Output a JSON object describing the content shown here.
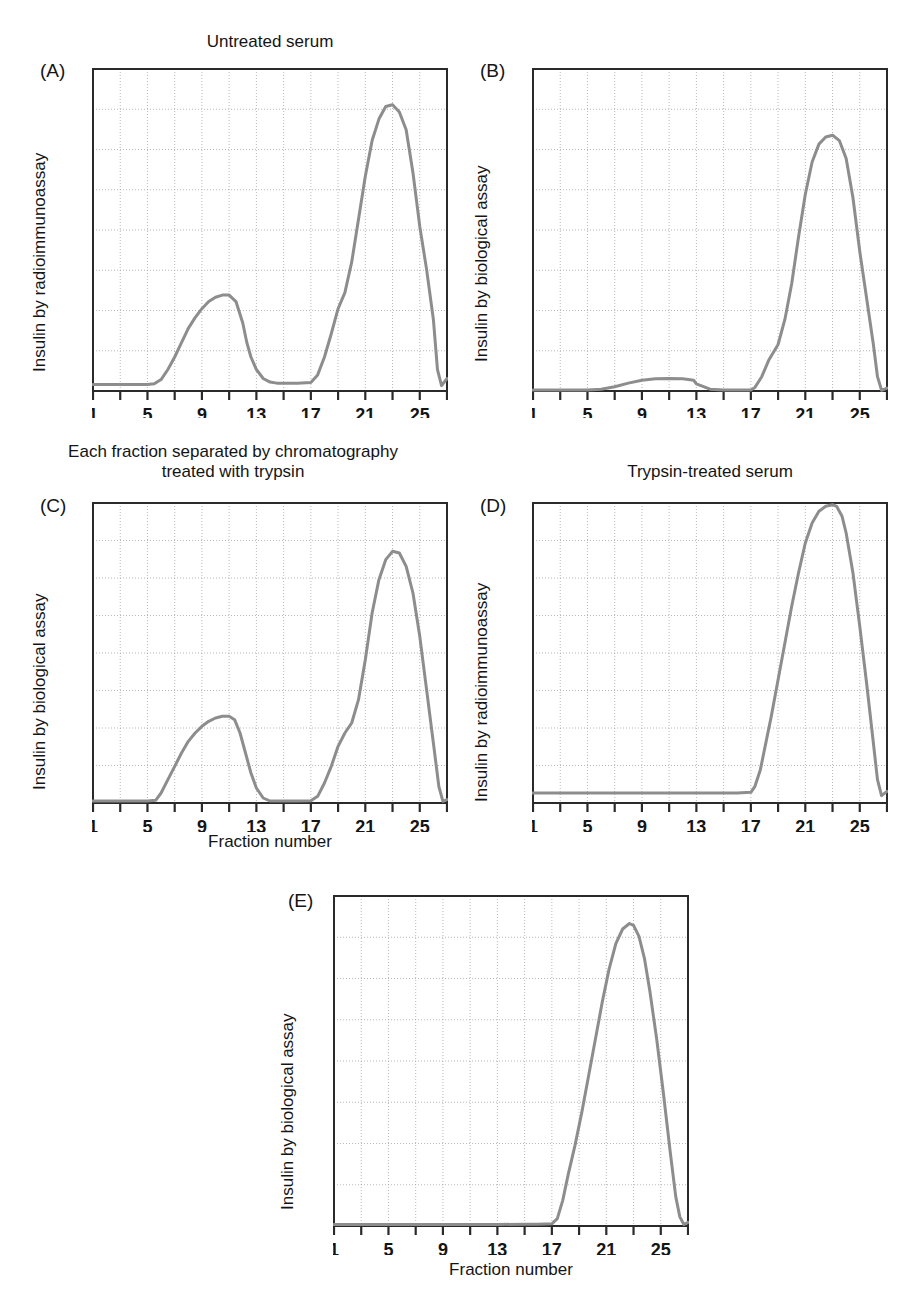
{
  "figure": {
    "titles": {
      "a": "Untreated serum",
      "b": "",
      "c": "Each fraction separated by chromatography\ntreated with trypsin",
      "d": "Trypsin-treated serum",
      "e": ""
    },
    "letters": {
      "a": "(A)",
      "b": "(B)",
      "c": "(C)",
      "d": "(D)",
      "e": "(E)"
    },
    "axis_labels": {
      "radioimmunoassay": "Insulin by radioimmunoassay",
      "biological": "Insulin by biological assay",
      "fraction": "Fraction number"
    },
    "colors": {
      "curve": "#8d8d8d",
      "frame": "#2a2a2a",
      "grid": "#9a9a9a",
      "text": "#141414"
    }
  },
  "chart_data": [
    {
      "id": "A",
      "type": "line",
      "title": "Untreated serum",
      "panel_label": "(A)",
      "xlabel": "",
      "ylabel": "Insulin by radioimmunoassay",
      "xlim": [
        1,
        27
      ],
      "ylim": [
        0,
        9
      ],
      "xticks": [
        1,
        3,
        5,
        7,
        9,
        11,
        13,
        15,
        17,
        19,
        21,
        23,
        25,
        27
      ],
      "xtick_labels": [
        "1",
        "",
        "5",
        "",
        "9",
        "",
        "13",
        "",
        "17",
        "",
        "21",
        "",
        "25",
        ""
      ],
      "ygrid_count": 8,
      "grid": true,
      "x": [
        1,
        2,
        3,
        4,
        5,
        5.5,
        6,
        6.5,
        7,
        7.5,
        8,
        8.5,
        9,
        9.5,
        10,
        10.5,
        11,
        11.5,
        12,
        12.3,
        12.6,
        13,
        13.5,
        14,
        14.5,
        15,
        16,
        17,
        17.5,
        18,
        18.5,
        19,
        19.5,
        20,
        20.5,
        21,
        21.5,
        22,
        22.5,
        23,
        23.5,
        24,
        24.5,
        25,
        25.5,
        26,
        26.3,
        26.6,
        27
      ],
      "y": [
        0.18,
        0.18,
        0.18,
        0.18,
        0.18,
        0.2,
        0.32,
        0.6,
        0.95,
        1.35,
        1.75,
        2.05,
        2.3,
        2.5,
        2.62,
        2.68,
        2.68,
        2.5,
        1.9,
        1.35,
        0.95,
        0.6,
        0.35,
        0.25,
        0.22,
        0.22,
        0.22,
        0.24,
        0.45,
        0.95,
        1.6,
        2.3,
        2.75,
        3.6,
        4.8,
        6.0,
        7.0,
        7.6,
        7.95,
        8.0,
        7.8,
        7.3,
        6.1,
        4.6,
        3.4,
        2.0,
        0.6,
        0.15,
        0.35
      ]
    },
    {
      "id": "B",
      "type": "line",
      "title": "",
      "panel_label": "(B)",
      "xlabel": "",
      "ylabel": "Insulin by biological assay",
      "xlim": [
        1,
        27
      ],
      "ylim": [
        0,
        9
      ],
      "xticks": [
        1,
        3,
        5,
        7,
        9,
        11,
        13,
        15,
        17,
        19,
        21,
        23,
        25,
        27
      ],
      "xtick_labels": [
        "1",
        "",
        "5",
        "",
        "9",
        "",
        "13",
        "",
        "17",
        "",
        "21",
        "",
        "25",
        ""
      ],
      "ygrid_count": 8,
      "grid": true,
      "x": [
        1,
        3,
        5,
        6,
        7,
        8,
        9,
        10,
        11,
        12,
        12.8,
        13,
        14,
        15,
        16,
        17,
        17.3,
        17.8,
        18.3,
        19,
        19.5,
        20,
        20.5,
        21,
        21.5,
        22,
        22.5,
        23,
        23.5,
        24,
        24.5,
        25,
        25.5,
        26,
        26.3,
        26.6,
        27
      ],
      "y": [
        0.03,
        0.03,
        0.03,
        0.05,
        0.12,
        0.22,
        0.3,
        0.34,
        0.35,
        0.34,
        0.3,
        0.2,
        0.05,
        0.03,
        0.03,
        0.03,
        0.1,
        0.4,
        0.85,
        1.3,
        2.0,
        3.0,
        4.3,
        5.5,
        6.4,
        6.9,
        7.1,
        7.15,
        7.0,
        6.5,
        5.4,
        3.9,
        2.6,
        1.3,
        0.4,
        0.02,
        0.08
      ]
    },
    {
      "id": "C",
      "type": "line",
      "title": "Each fraction separated by chromatography\ntreated with trypsin",
      "panel_label": "(C)",
      "xlabel": "Fraction number",
      "ylabel": "Insulin by biological assay",
      "xlim": [
        1,
        27
      ],
      "ylim": [
        0,
        9
      ],
      "xticks": [
        1,
        3,
        5,
        7,
        9,
        11,
        13,
        15,
        17,
        19,
        21,
        23,
        25,
        27
      ],
      "xtick_labels": [
        "1",
        "",
        "5",
        "",
        "9",
        "",
        "13",
        "",
        "17",
        "",
        "21",
        "",
        "25",
        ""
      ],
      "ygrid_count": 8,
      "grid": true,
      "x": [
        1,
        3,
        5,
        5.6,
        6,
        6.5,
        7,
        7.5,
        8,
        8.5,
        9,
        9.5,
        10,
        10.5,
        11,
        11.4,
        11.8,
        12.2,
        12.6,
        13,
        13.5,
        14,
        15,
        16,
        17,
        17.5,
        18,
        18.5,
        19,
        19.5,
        20,
        20.5,
        21,
        21.5,
        22,
        22.5,
        23,
        23.5,
        24,
        24.5,
        25,
        25.5,
        26,
        26.4,
        26.7,
        27
      ],
      "y": [
        0.06,
        0.06,
        0.06,
        0.08,
        0.3,
        0.7,
        1.1,
        1.5,
        1.85,
        2.1,
        2.3,
        2.45,
        2.55,
        2.6,
        2.6,
        2.5,
        2.1,
        1.5,
        0.9,
        0.45,
        0.15,
        0.06,
        0.06,
        0.06,
        0.07,
        0.2,
        0.6,
        1.1,
        1.7,
        2.1,
        2.4,
        3.1,
        4.3,
        5.7,
        6.7,
        7.3,
        7.55,
        7.5,
        7.1,
        6.3,
        5.0,
        3.4,
        1.8,
        0.5,
        0.05,
        0.1
      ]
    },
    {
      "id": "D",
      "type": "line",
      "title": "Trypsin-treated serum",
      "panel_label": "(D)",
      "xlabel": "",
      "ylabel": "Insulin by radioimmunoassay",
      "xlim": [
        1,
        27
      ],
      "ylim": [
        0,
        9
      ],
      "xticks": [
        1,
        3,
        5,
        7,
        9,
        11,
        13,
        15,
        17,
        19,
        21,
        23,
        25,
        27
      ],
      "xtick_labels": [
        "1",
        "",
        "5",
        "",
        "9",
        "",
        "13",
        "",
        "17",
        "",
        "21",
        "",
        "25",
        ""
      ],
      "ygrid_count": 8,
      "grid": true,
      "x": [
        1,
        3,
        5,
        7,
        9,
        11,
        13,
        15,
        16,
        17,
        17.3,
        17.7,
        18,
        18.5,
        19,
        19.5,
        20,
        20.5,
        21,
        21.5,
        22,
        22.5,
        23,
        23.3,
        23.7,
        24,
        24.5,
        25,
        25.5,
        26,
        26.3,
        26.6,
        27
      ],
      "y": [
        0.3,
        0.3,
        0.3,
        0.3,
        0.3,
        0.3,
        0.3,
        0.3,
        0.3,
        0.32,
        0.5,
        1.0,
        1.6,
        2.6,
        3.7,
        4.8,
        5.9,
        6.9,
        7.8,
        8.4,
        8.75,
        8.9,
        8.95,
        8.9,
        8.6,
        8.1,
        6.9,
        5.3,
        3.6,
        1.8,
        0.7,
        0.22,
        0.35
      ]
    },
    {
      "id": "E",
      "type": "line",
      "title": "",
      "panel_label": "(E)",
      "xlabel": "Fraction number",
      "ylabel": "Insulin by biological assay",
      "xlim": [
        1,
        27
      ],
      "ylim": [
        0,
        9
      ],
      "xticks": [
        1,
        3,
        5,
        7,
        9,
        11,
        13,
        15,
        17,
        19,
        21,
        23,
        25,
        27
      ],
      "xtick_labels": [
        "1",
        "",
        "5",
        "",
        "9",
        "",
        "13",
        "",
        "17",
        "",
        "21",
        "",
        "25",
        ""
      ],
      "ygrid_count": 8,
      "grid": true,
      "x": [
        1,
        3,
        5,
        7,
        9,
        11,
        13,
        15,
        16,
        17,
        17.4,
        17.8,
        18.2,
        18.7,
        19.2,
        19.7,
        20.2,
        20.7,
        21.2,
        21.7,
        22.2,
        22.7,
        23,
        23.4,
        23.8,
        24.2,
        24.7,
        25.2,
        25.7,
        26.1,
        26.4,
        26.7,
        27
      ],
      "y": [
        0.04,
        0.04,
        0.04,
        0.04,
        0.04,
        0.04,
        0.04,
        0.05,
        0.05,
        0.06,
        0.2,
        0.7,
        1.4,
        2.2,
        3.1,
        4.1,
        5.1,
        6.1,
        7.0,
        7.7,
        8.1,
        8.25,
        8.2,
        7.9,
        7.3,
        6.4,
        5.1,
        3.6,
        2.0,
        0.8,
        0.25,
        0.04,
        0.1
      ]
    }
  ]
}
